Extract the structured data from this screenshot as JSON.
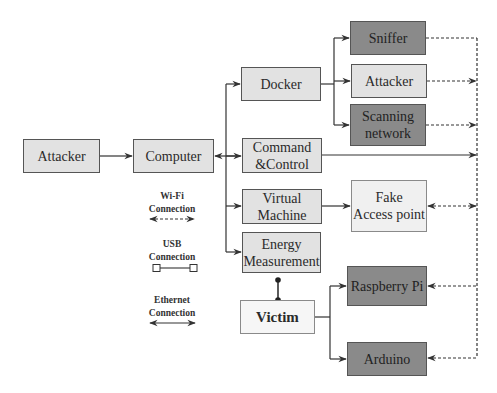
{
  "diagram": {
    "title": "",
    "colors": {
      "light_box": "#e2e2e2",
      "dark_box": "#8a8a8a",
      "white_box": "#f6f6f6",
      "line": "#333333"
    },
    "nodes": {
      "attacker_source": "Attacker",
      "computer": "Computer",
      "docker": "Docker",
      "command_control_1": "Command",
      "command_control_2": "&Control",
      "virtual_machine_1": "Virtual",
      "virtual_machine_2": "Machine",
      "energy_measurement_1": "Energy",
      "energy_measurement_2": "Measurement",
      "victim": "Victim",
      "sniffer": "Sniffer",
      "attacker_container": "Attacker",
      "scanning_network_1": "Scanning",
      "scanning_network_2": "network",
      "fake_access_point_1": "Fake",
      "fake_access_point_2": "Access point",
      "raspberry_pi": "Raspberry Pi",
      "arduino": "Arduino"
    },
    "legend": {
      "wifi": {
        "line1": "Wi-Fi",
        "line2": "Connection",
        "style": "dashed-double-arrow"
      },
      "usb": {
        "line1": "USB",
        "line2": "Connection",
        "style": "line-with-square-ends"
      },
      "ethernet": {
        "line1": "Ethernet",
        "line2": "Connection",
        "style": "solid-double-arrow"
      }
    },
    "edges": [
      {
        "from": "Attacker",
        "to": "Computer",
        "type": "solid-arrow"
      },
      {
        "from": "Computer",
        "to": "Docker / Command&Control / Virtual Machine / Energy Measurement",
        "type": "ethernet"
      },
      {
        "from": "Docker",
        "to": "Sniffer",
        "type": "solid-arrow"
      },
      {
        "from": "Docker",
        "to": "Attacker",
        "type": "solid-arrow"
      },
      {
        "from": "Docker",
        "to": "Scanning network",
        "type": "solid-arrow"
      },
      {
        "from": "Command&Control",
        "to": "Wi-Fi bus",
        "type": "solid-arrow"
      },
      {
        "from": "Virtual Machine",
        "to": "Fake Access point",
        "type": "solid-arrow"
      },
      {
        "from": "Energy Measurement",
        "to": "Victim",
        "type": "usb"
      },
      {
        "from": "Victim",
        "to": "Raspberry Pi",
        "type": "solid-arrow"
      },
      {
        "from": "Victim",
        "to": "Arduino",
        "type": "solid-arrow"
      },
      {
        "from": "Sniffer",
        "to": "Wi-Fi bus",
        "type": "wifi"
      },
      {
        "from": "Attacker",
        "to": "Wi-Fi bus",
        "type": "wifi"
      },
      {
        "from": "Scanning network",
        "to": "Wi-Fi bus",
        "type": "wifi"
      },
      {
        "from": "Fake Access point",
        "to": "Wi-Fi bus",
        "type": "wifi"
      },
      {
        "from": "Raspberry Pi",
        "to": "Wi-Fi bus",
        "type": "wifi"
      },
      {
        "from": "Arduino",
        "to": "Wi-Fi bus",
        "type": "wifi"
      }
    ]
  }
}
